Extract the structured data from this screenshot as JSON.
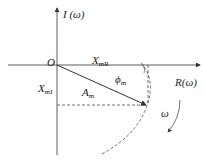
{
  "diagram": {
    "type": "nyquist-plot",
    "axes": {
      "vertical_label": "I (ω)",
      "horizontal_label": "R(ω)",
      "origin_label": "O"
    },
    "labels": {
      "x_mR": {
        "main": "X",
        "sub": "mR"
      },
      "x_mI": {
        "main": "X",
        "sub": "mI"
      },
      "a_m": {
        "main": "A",
        "sub": "m"
      },
      "phi_m": {
        "main": "ϕ",
        "sub": "m"
      },
      "omega": "ω"
    },
    "colors": {
      "line": "#333333",
      "background": "#ffffff"
    }
  }
}
